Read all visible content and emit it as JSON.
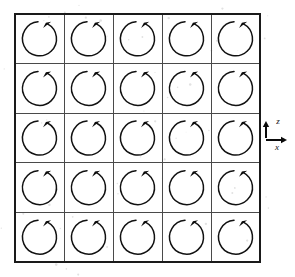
{
  "figure": {
    "background_color": "#ffffff"
  },
  "lattice": {
    "rows": 5,
    "cols": 5,
    "origin_x": 15,
    "origin_y": 14,
    "cell_width": 49,
    "cell_height": 49.6,
    "grid_line_color": "#4a4a4a",
    "border_color": "#1a1a1a",
    "cells": [
      {
        "row": 0,
        "col": 0,
        "direction": "clockwise"
      },
      {
        "row": 0,
        "col": 1,
        "direction": "clockwise"
      },
      {
        "row": 0,
        "col": 2,
        "direction": "clockwise"
      },
      {
        "row": 0,
        "col": 3,
        "direction": "clockwise"
      },
      {
        "row": 0,
        "col": 4,
        "direction": "clockwise"
      },
      {
        "row": 1,
        "col": 0,
        "direction": "clockwise"
      },
      {
        "row": 1,
        "col": 1,
        "direction": "clockwise"
      },
      {
        "row": 1,
        "col": 2,
        "direction": "clockwise"
      },
      {
        "row": 1,
        "col": 3,
        "direction": "clockwise"
      },
      {
        "row": 1,
        "col": 4,
        "direction": "clockwise"
      },
      {
        "row": 2,
        "col": 0,
        "direction": "clockwise"
      },
      {
        "row": 2,
        "col": 1,
        "direction": "clockwise"
      },
      {
        "row": 2,
        "col": 2,
        "direction": "clockwise"
      },
      {
        "row": 2,
        "col": 3,
        "direction": "clockwise"
      },
      {
        "row": 2,
        "col": 4,
        "direction": "clockwise"
      },
      {
        "row": 3,
        "col": 0,
        "direction": "clockwise"
      },
      {
        "row": 3,
        "col": 1,
        "direction": "clockwise"
      },
      {
        "row": 3,
        "col": 2,
        "direction": "clockwise"
      },
      {
        "row": 3,
        "col": 3,
        "direction": "clockwise"
      },
      {
        "row": 3,
        "col": 4,
        "direction": "clockwise"
      },
      {
        "row": 4,
        "col": 0,
        "direction": "clockwise"
      },
      {
        "row": 4,
        "col": 1,
        "direction": "clockwise"
      },
      {
        "row": 4,
        "col": 2,
        "direction": "clockwise"
      },
      {
        "row": 4,
        "col": 3,
        "direction": "clockwise"
      },
      {
        "row": 4,
        "col": 4,
        "direction": "clockwise"
      }
    ],
    "arrow": {
      "radius": 17,
      "gap_start_deg": 62,
      "gap_end_deg": 95,
      "stroke_color": "#111111",
      "stroke_width": 1.5
    }
  },
  "axes": {
    "position_x": 266,
    "position_y": 138,
    "color": "#0a0a0a",
    "vertical": {
      "label": "z",
      "direction": "up",
      "length": 16,
      "label_x": 278,
      "label_y": 124
    },
    "horizontal": {
      "label": "x",
      "direction": "right",
      "length": 20,
      "label_x": 277,
      "label_y": 150
    }
  }
}
